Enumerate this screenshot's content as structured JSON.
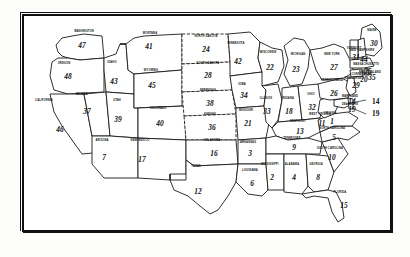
{
  "figure": {
    "kind": "numbered-us-state-map",
    "border_color": "#111111",
    "fill_color": "#ffffff",
    "background": "#ffffff"
  },
  "chart_data": {
    "type": "map",
    "title": "",
    "subtitle": "",
    "xlabel": "",
    "ylabel": "",
    "legend_position": "none",
    "grid": false,
    "categories": [
      "MISSISSIPPI",
      "ALABAMA",
      "NORTH CAROLINA",
      "LOUISIANA",
      "ARIZONA",
      "GEORGIA",
      "TENNESSEE",
      "SOUTH CAROLINA",
      "WEST VIRGINIA",
      "TEXAS",
      "KENTUCKY",
      "MARYLAND",
      "FLORIDA",
      "OKLAHOMA",
      "NEW MEXICO",
      "INDIANA",
      "DELAWARE",
      "MISSOURI",
      "WISCONSIN",
      "MICHIGAN",
      "NORTH DAKOTA",
      "PENNSYLVANIA",
      "NEW YORK",
      "SOUTH DAKOTA",
      "NEW JERSEY",
      "MAINE",
      "OHIO",
      "ILLINOIS",
      "IOWA",
      "NEBRASKA",
      "UTAH",
      "COLORADO",
      "MONTANA",
      "MINNESOTA",
      "IDAHO",
      "NEW HAMPSHIRE",
      "WYOMING",
      "CALIFORNIA",
      "WASHINGTON",
      "OREGON",
      "NEVADA",
      "KANSAS",
      "VERMONT",
      "MASSACHUSETTS",
      "CONNECTICUT",
      "RHODE ISLAND",
      "VIRGINIA",
      "ARKANSAS"
    ],
    "values": [
      2,
      4,
      5,
      6,
      7,
      8,
      9,
      10,
      11,
      12,
      13,
      14,
      15,
      16,
      17,
      18,
      19,
      21,
      22,
      23,
      24,
      26,
      27,
      28,
      29,
      30,
      32,
      33,
      34,
      38,
      39,
      40,
      41,
      42,
      43,
      44,
      45,
      46,
      47,
      48,
      37,
      36,
      31,
      25,
      20,
      35,
      1,
      3
    ]
  },
  "states": [
    {
      "name": "WASHINGTON",
      "num": "47",
      "nx": 60,
      "ny": 32,
      "lx": 62,
      "ly": 17
    },
    {
      "name": "OREGON",
      "num": "48",
      "nx": 46,
      "ny": 63,
      "lx": 42,
      "ly": 49
    },
    {
      "name": "CALIFORNIA",
      "num": "46",
      "nx": 38,
      "ny": 116,
      "lx": 22,
      "ly": 86
    },
    {
      "name": "IDAHO",
      "num": "43",
      "nx": 92,
      "ny": 68,
      "lx": 90,
      "ly": 48
    },
    {
      "name": "NEVADA",
      "num": "37",
      "nx": 65,
      "ny": 98,
      "lx": 60,
      "ly": 80
    },
    {
      "name": "UTAH",
      "num": "39",
      "nx": 96,
      "ny": 106,
      "lx": 95,
      "ly": 86
    },
    {
      "name": "ARIZONA",
      "num": "7",
      "nx": 82,
      "ny": 144,
      "lx": 80,
      "ly": 126
    },
    {
      "name": "MONTANA",
      "num": "41",
      "nx": 127,
      "ny": 33,
      "lx": 128,
      "ly": 19
    },
    {
      "name": "WYOMING",
      "num": "45",
      "nx": 130,
      "ny": 72,
      "lx": 129,
      "ly": 56
    },
    {
      "name": "COLORADO",
      "num": "40",
      "nx": 138,
      "ny": 110,
      "lx": 136,
      "ly": 94
    },
    {
      "name": "NEW MEXICO",
      "num": "17",
      "nx": 120,
      "ny": 146,
      "lx": 118,
      "ly": 126
    },
    {
      "name": "NORTH DAKOTA",
      "num": "24",
      "nx": 184,
      "ny": 36,
      "lx": 184,
      "ly": 22
    },
    {
      "name": "SOUTH DAKOTA",
      "num": "28",
      "nx": 186,
      "ny": 62,
      "lx": 186,
      "ly": 49
    },
    {
      "name": "NEBRASKA",
      "num": "38",
      "nx": 188,
      "ny": 90,
      "lx": 186,
      "ly": 76
    },
    {
      "name": "KANSAS",
      "num": "36",
      "nx": 190,
      "ny": 114,
      "lx": 188,
      "ly": 100
    },
    {
      "name": "OKLAHOMA",
      "num": "16",
      "nx": 192,
      "ny": 140,
      "lx": 190,
      "ly": 126
    },
    {
      "name": "TEXAS",
      "num": "12",
      "nx": 176,
      "ny": 178,
      "lx": 174,
      "ly": 152
    },
    {
      "name": "MINNESOTA",
      "num": "42",
      "nx": 216,
      "ny": 48,
      "lx": 214,
      "ly": 29
    },
    {
      "name": "IOWA",
      "num": "34",
      "nx": 222,
      "ny": 82,
      "lx": 220,
      "ly": 70
    },
    {
      "name": "MISSOURI",
      "num": "21",
      "nx": 226,
      "ny": 110,
      "lx": 224,
      "ly": 96
    },
    {
      "name": "ARKANSAS",
      "num": "3",
      "nx": 228,
      "ny": 140,
      "lx": 226,
      "ly": 128
    },
    {
      "name": "LOUISIANA",
      "num": "6",
      "nx": 230,
      "ny": 170,
      "lx": 228,
      "ly": 156
    },
    {
      "name": "WISCONSIN",
      "num": "22",
      "nx": 248,
      "ny": 54,
      "lx": 246,
      "ly": 38
    },
    {
      "name": "ILLINOIS",
      "num": "33",
      "nx": 245,
      "ny": 98,
      "lx": 244,
      "ly": 84
    },
    {
      "name": "MICHIGAN",
      "num": "23",
      "nx": 274,
      "ny": 56,
      "lx": 276,
      "ly": 40
    },
    {
      "name": "INDIANA",
      "num": "18",
      "nx": 267,
      "ny": 98,
      "lx": 266,
      "ly": 84
    },
    {
      "name": "OHIO",
      "num": "32",
      "nx": 290,
      "ny": 94,
      "lx": 289,
      "ly": 80
    },
    {
      "name": "KENTUCKY",
      "num": "13",
      "nx": 278,
      "ny": 118,
      "lx": 276,
      "ly": 107
    },
    {
      "name": "TENNESSEE",
      "num": "9",
      "nx": 272,
      "ny": 134,
      "lx": 270,
      "ly": 124
    },
    {
      "name": "MISSISSIPPI",
      "num": "2",
      "nx": 250,
      "ny": 164,
      "lx": 248,
      "ly": 150
    },
    {
      "name": "ALABAMA",
      "num": "4",
      "nx": 272,
      "ny": 164,
      "lx": 270,
      "ly": 150
    },
    {
      "name": "GEORGIA",
      "num": "8",
      "nx": 296,
      "ny": 164,
      "lx": 294,
      "ly": 150
    },
    {
      "name": "FLORIDA",
      "num": "15",
      "nx": 322,
      "ny": 192,
      "lx": 318,
      "ly": 178
    },
    {
      "name": "SOUTH CAROLINA",
      "num": "10",
      "nx": 310,
      "ny": 144,
      "lx": 308,
      "ly": 134
    },
    {
      "name": "NORTH CAROLINA",
      "num": "5",
      "nx": 312,
      "ny": 124,
      "lx": 310,
      "ly": 114
    },
    {
      "name": "WEST VIRGINIA",
      "num": "11",
      "nx": 300,
      "ny": 110,
      "lx": 298,
      "ly": 100
    },
    {
      "name": "VIRGINIA",
      "num": "1",
      "nx": 310,
      "ny": 108,
      "lx": 308,
      "ly": 99
    },
    {
      "name": "PENNSYLVANIA",
      "num": "26",
      "nx": 312,
      "ny": 80,
      "lx": 310,
      "ly": 66
    },
    {
      "name": "NEW YORK",
      "num": "27",
      "nx": 312,
      "ny": 54,
      "lx": 310,
      "ly": 40
    },
    {
      "name": "MAINE",
      "num": "30",
      "nx": 352,
      "ny": 30,
      "lx": 350,
      "ly": 16
    },
    {
      "name": "NEW HAMPSHIRE",
      "num": "44",
      "nx": 342,
      "ny": 46,
      "lx": 340,
      "ly": 36
    },
    {
      "name": "VERMONT",
      "num": "31",
      "nx": 334,
      "ny": 44,
      "lx": 332,
      "ly": 34
    },
    {
      "name": "MASSACHUSETTS",
      "num": "25",
      "nx": 346,
      "ny": 58,
      "lx": 344,
      "ly": 50
    },
    {
      "name": "CONNECTICUT",
      "num": "20",
      "nx": 342,
      "ny": 66,
      "lx": 340,
      "ly": 60
    },
    {
      "name": "RHODE ISLAND",
      "num": "35",
      "nx": 350,
      "ny": 64,
      "lx": 348,
      "ly": 58
    },
    {
      "name": "NEW JERSEY",
      "num": "29",
      "nx": 334,
      "ny": 72,
      "lx": 332,
      "ly": 64
    },
    {
      "name": "MARYLAND",
      "num": "14",
      "nx": 330,
      "ny": 88,
      "lx": 328,
      "ly": 82
    },
    {
      "name": "DELAWARE",
      "num": "19",
      "nx": 330,
      "ny": 96,
      "lx": 328,
      "ly": 90
    }
  ],
  "callouts": [
    {
      "label": "14",
      "x": 350,
      "y": 88,
      "target_x": 322,
      "target_y": 90
    },
    {
      "label": "19",
      "x": 350,
      "y": 100,
      "target_x": 320,
      "target_y": 96
    }
  ]
}
